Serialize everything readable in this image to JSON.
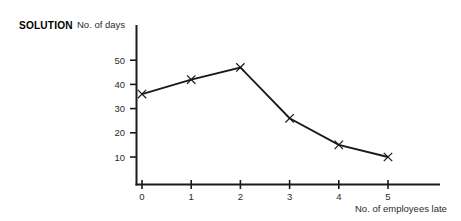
{
  "figure": {
    "solution_label": "SOLUTION"
  },
  "chart_data": {
    "type": "line",
    "title": "",
    "xlabel": "No. of employees late",
    "ylabel": "No. of days",
    "x": [
      0,
      1,
      2,
      3,
      4,
      5
    ],
    "values": [
      36,
      42,
      47,
      26,
      15,
      10
    ],
    "categories": [
      "0",
      "1",
      "2",
      "3",
      "4",
      "5"
    ],
    "xticklabels": [
      "0",
      "1",
      "2",
      "3",
      "4",
      "5"
    ],
    "yticklabels": [
      "10",
      "20",
      "30",
      "40",
      "50"
    ],
    "yticks": [
      10,
      20,
      30,
      40,
      50
    ],
    "xlim": [
      0,
      5
    ],
    "ylim": [
      0,
      55
    ],
    "grid": false,
    "legend": false,
    "marker": "x",
    "line_color": "#1a1a1a",
    "marker_color": "#1a1a1a",
    "axis_color": "#1a1a1a",
    "background": "#ffffff"
  }
}
